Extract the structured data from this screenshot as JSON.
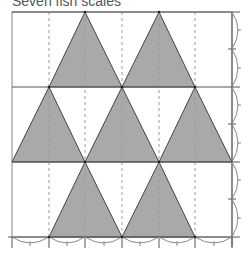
{
  "title": "Seven fish scales",
  "diagram": {
    "type": "tessellation",
    "shape": "isosceles-triangle",
    "count": 7,
    "fill_color": "#a9a9a9",
    "line_color": "#444444",
    "dashed_color": "#9a9a9a",
    "grid": {
      "columns": 6,
      "rows": 3
    },
    "rows": [
      {
        "row": 1,
        "apex_columns": [
          2,
          4
        ]
      },
      {
        "row": 2,
        "apex_columns": [
          1,
          3,
          5
        ]
      },
      {
        "row": 3,
        "apex_columns": [
          2,
          4
        ]
      }
    ]
  }
}
